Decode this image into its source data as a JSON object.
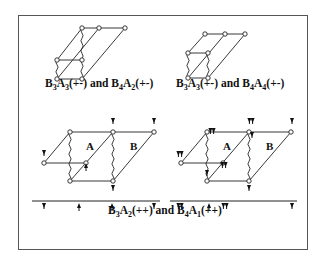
{
  "figure": {
    "frame": {
      "x": 18,
      "y": 15,
      "w": 290,
      "h": 235
    },
    "captions": [
      {
        "id": "top-left",
        "x": 45,
        "y": 87,
        "parts": [
          [
            "B",
            "3"
          ],
          [
            "A",
            "3"
          ],
          "(+-) and ",
          [
            "B",
            "4"
          ],
          [
            "A",
            "2"
          ],
          "(+-)"
        ]
      },
      {
        "id": "top-right",
        "x": 176,
        "y": 87,
        "parts": [
          [
            "B",
            "3"
          ],
          [
            "A",
            "3"
          ],
          "(+-) and ",
          [
            "B",
            "4"
          ],
          [
            "A",
            "4"
          ],
          "(+-)"
        ]
      },
      {
        "id": "bottom",
        "x": 108,
        "y": 214,
        "parts": [
          [
            "B",
            "3"
          ],
          [
            "A",
            "2"
          ],
          "(++) and ",
          [
            "B",
            "4"
          ],
          [
            "A",
            "1"
          ],
          "(++)"
        ]
      }
    ],
    "diagrams": [
      {
        "id": "top-left-lattice",
        "nodes": [
          [
            82,
            28
          ],
          [
            99,
            28
          ],
          [
            125,
            28
          ],
          [
            57,
            60
          ],
          [
            82,
            60
          ],
          [
            57,
            79
          ],
          [
            82,
            79
          ]
        ],
        "lines": [
          [
            [
              82,
              28
            ],
            [
              125,
              28
            ]
          ],
          [
            [
              82,
              28
            ],
            [
              57,
              60
            ]
          ],
          [
            [
              99,
              28
            ],
            [
              57,
              79
            ]
          ],
          [
            [
              125,
              28
            ],
            [
              82,
              79
            ]
          ],
          [
            [
              57,
              60
            ],
            [
              82,
              60
            ]
          ],
          [
            [
              57,
              79
            ],
            [
              82,
              79
            ]
          ]
        ],
        "wavy": [
          [
            [
              57,
              60
            ],
            [
              57,
              79
            ]
          ],
          [
            [
              82,
              28
            ],
            [
              82,
              79
            ]
          ]
        ],
        "arrows": [],
        "labels": []
      },
      {
        "id": "top-right-lattice",
        "nodes": [
          [
            205,
            34
          ],
          [
            225,
            34
          ],
          [
            245,
            34
          ],
          [
            188,
            53
          ],
          [
            208,
            53
          ],
          [
            188,
            78
          ],
          [
            208,
            78
          ]
        ],
        "lines": [
          [
            [
              205,
              34
            ],
            [
              245,
              34
            ]
          ],
          [
            [
              205,
              34
            ],
            [
              188,
              53
            ]
          ],
          [
            [
              225,
              34
            ],
            [
              188,
              78
            ]
          ],
          [
            [
              245,
              34
            ],
            [
              208,
              78
            ]
          ],
          [
            [
              188,
              53
            ],
            [
              208,
              53
            ]
          ],
          [
            [
              188,
              78
            ],
            [
              208,
              78
            ]
          ]
        ],
        "wavy": [
          [
            [
              188,
              53
            ],
            [
              188,
              78
            ]
          ],
          [
            [
              208,
              53
            ],
            [
              208,
              78
            ]
          ]
        ],
        "arrows": [],
        "labels": []
      },
      {
        "id": "bottom-left-lattice",
        "nodes": [
          [
            70,
            132
          ],
          [
            113,
            132
          ],
          [
            154,
            132
          ],
          [
            44,
            163
          ],
          [
            86,
            163
          ],
          [
            70,
            181
          ],
          [
            113,
            181
          ]
        ],
        "lines": [
          [
            [
              70,
              132
            ],
            [
              154,
              132
            ]
          ],
          [
            [
              70,
              132
            ],
            [
              44,
              163
            ]
          ],
          [
            [
              113,
              132
            ],
            [
              70,
              181
            ]
          ],
          [
            [
              154,
              132
            ],
            [
              113,
              181
            ]
          ],
          [
            [
              44,
              163
            ],
            [
              86,
              163
            ]
          ],
          [
            [
              70,
              181
            ],
            [
              113,
              181
            ]
          ]
        ],
        "wavy": [
          [
            [
              70,
              132
            ],
            [
              70,
              181
            ]
          ],
          [
            [
              113,
              132
            ],
            [
              113,
              181
            ]
          ]
        ],
        "arrows": [
          {
            "x": 113,
            "y": 122,
            "dir": "down",
            "n": 1
          },
          {
            "x": 154,
            "y": 122,
            "dir": "down",
            "n": 1
          },
          {
            "x": 44,
            "y": 154,
            "dir": "down",
            "n": 1
          },
          {
            "x": 86,
            "y": 167,
            "dir": "up",
            "n": 1
          },
          {
            "x": 113,
            "y": 189,
            "dir": "down",
            "n": 1
          }
        ],
        "labels": [
          {
            "text": "A",
            "x": 86,
            "y": 150
          },
          {
            "text": "B",
            "x": 130,
            "y": 150
          }
        ],
        "axis": {
          "x1": 32,
          "x2": 160,
          "y": 201,
          "ticks": [
            {
              "x": 44,
              "dir": "down",
              "n": 1
            },
            {
              "x": 79,
              "dir": "up",
              "n": 1
            },
            {
              "x": 112,
              "dir": "up",
              "n": 1
            },
            {
              "x": 154,
              "dir": "down",
              "n": 1
            }
          ]
        }
      },
      {
        "id": "bottom-right-lattice",
        "nodes": [
          [
            207,
            132
          ],
          [
            249,
            132
          ],
          [
            291,
            132
          ],
          [
            181,
            163
          ],
          [
            223,
            163
          ],
          [
            207,
            181
          ],
          [
            249,
            181
          ]
        ],
        "lines": [
          [
            [
              207,
              132
            ],
            [
              291,
              132
            ]
          ],
          [
            [
              207,
              132
            ],
            [
              181,
              163
            ]
          ],
          [
            [
              249,
              132
            ],
            [
              207,
              181
            ]
          ],
          [
            [
              291,
              132
            ],
            [
              249,
              181
            ]
          ],
          [
            [
              181,
              163
            ],
            [
              223,
              163
            ]
          ],
          [
            [
              207,
              181
            ],
            [
              249,
              181
            ]
          ]
        ],
        "wavy": [
          [
            [
              207,
              132
            ],
            [
              207,
              181
            ]
          ],
          [
            [
              249,
              132
            ],
            [
              249,
              181
            ]
          ]
        ],
        "arrows": [
          {
            "x": 212,
            "y": 132,
            "dir": "down",
            "n": 2
          },
          {
            "x": 251,
            "y": 122,
            "dir": "down",
            "n": 2
          },
          {
            "x": 292,
            "y": 122,
            "dir": "down",
            "n": 1
          },
          {
            "x": 180,
            "y": 155,
            "dir": "down",
            "n": 2
          },
          {
            "x": 224,
            "y": 166,
            "dir": "down",
            "n": 2
          },
          {
            "x": 252,
            "y": 136,
            "dir": "down",
            "n": 1
          },
          {
            "x": 207,
            "y": 174,
            "dir": "down",
            "n": 1
          },
          {
            "x": 249,
            "y": 189,
            "dir": "down",
            "n": 1
          }
        ],
        "labels": [
          {
            "text": "A",
            "x": 223,
            "y": 150
          },
          {
            "text": "B",
            "x": 266,
            "y": 150
          }
        ],
        "axis": {
          "x1": 170,
          "x2": 297,
          "y": 201,
          "ticks": [
            {
              "x": 180,
              "dir": "down",
              "n": 2
            },
            {
              "x": 209,
              "dir": "up",
              "n": 1
            },
            {
              "x": 225,
              "dir": "down",
              "n": 2
            },
            {
              "x": 292,
              "dir": "down",
              "n": 1
            }
          ]
        }
      }
    ]
  }
}
